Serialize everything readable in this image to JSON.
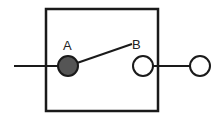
{
  "diagram": {
    "labels": {
      "a": "A",
      "b": "B"
    },
    "colors": {
      "stroke": "#1a1a1a",
      "terminal_a_fill": "#555555",
      "terminal_b_fill": "#ffffff",
      "background": "#ffffff"
    }
  }
}
